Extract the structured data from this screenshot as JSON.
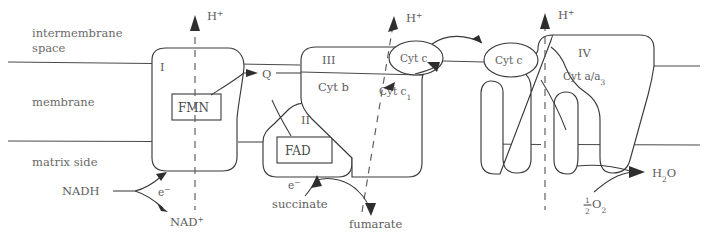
{
  "diagram": {
    "regions": [
      {
        "id": "intermembrane",
        "line1": "intermembrane",
        "line2": "space"
      },
      {
        "id": "membrane",
        "label": "membrane"
      },
      {
        "id": "matrix",
        "label": "matrix side"
      }
    ],
    "complexes": [
      {
        "id": "complex-1",
        "roman": "I",
        "cofactor": "FMN"
      },
      {
        "id": "complex-2",
        "roman": "II",
        "cofactor": "FAD"
      },
      {
        "id": "complex-3",
        "roman": "III",
        "cofactor": "Cyt b",
        "cofactor2": "Cyt c",
        "cofactor2_sub": "1"
      },
      {
        "id": "complex-4",
        "roman": "IV",
        "cofactor": "Cyt a/a",
        "cofactor_sub": "3"
      }
    ],
    "carriers": [
      {
        "id": "ubiquinone",
        "label": "Q"
      },
      {
        "id": "cytochrome-c-left",
        "label": "Cyt c"
      },
      {
        "id": "cytochrome-c-right",
        "label": "Cyt c"
      }
    ],
    "proton_pumps": [
      {
        "id": "proton-complex-1",
        "label": "H",
        "charge": "+"
      },
      {
        "id": "proton-complex-3",
        "label": "H",
        "charge": "+"
      },
      {
        "id": "proton-complex-4",
        "label": "H",
        "charge": "+"
      }
    ],
    "substrates": [
      {
        "id": "nadh",
        "label": "NADH"
      },
      {
        "id": "nad-plus",
        "label": "NAD",
        "charge": "+"
      },
      {
        "id": "succinate",
        "label": "succinate"
      },
      {
        "id": "fumarate",
        "label": "fumarate"
      },
      {
        "id": "oxygen",
        "numerator": "1",
        "denominator": "2",
        "label": "O",
        "sub": "2"
      },
      {
        "id": "water",
        "label": "H",
        "sub": "2",
        "label2": "O"
      }
    ],
    "electron_labels": [
      {
        "id": "electron-complex-1",
        "label": "e",
        "charge": "−"
      },
      {
        "id": "electron-complex-2",
        "label": "e",
        "charge": "−"
      }
    ],
    "colors": {
      "stroke": "#3a3a3a",
      "text": "#5d5d5d",
      "background": "#ffffff",
      "dashed": "#5a5a5a"
    }
  }
}
